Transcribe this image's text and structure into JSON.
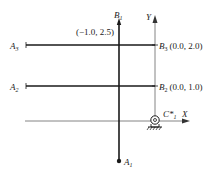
{
  "diagram": {
    "title": "",
    "points": {
      "B1": {
        "label": "B",
        "sub": "1",
        "coord": "(−1.0, 2.5)"
      },
      "B2": {
        "label": "B",
        "sub": "2",
        "coord": "(0.0, 1.0)"
      },
      "B3": {
        "label": "B",
        "sub": "3",
        "coord": "(0.0, 2.0)"
      },
      "A1": {
        "label": "A",
        "sub": "1"
      },
      "A2": {
        "label": "A",
        "sub": "2"
      },
      "A3": {
        "label": "A",
        "sub": "3"
      },
      "C1": {
        "label": "C*",
        "sub": "1"
      }
    },
    "axes": {
      "x_label": "X",
      "y_label": "Y"
    },
    "colors": {
      "line": "#1a1a1a",
      "axis": "#555555"
    }
  }
}
